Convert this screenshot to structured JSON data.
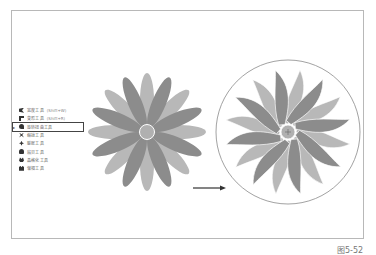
{
  "figure": {
    "caption": "图5-52",
    "frame_color": "#b8b8b8"
  },
  "tool_menu": {
    "items": [
      {
        "label": "宽度工具",
        "shortcut": "(Shift+W)",
        "icon": "width-tool-icon",
        "active": false
      },
      {
        "label": "变形工具",
        "shortcut": "(Shift+R)",
        "icon": "warp-tool-icon",
        "active": false
      },
      {
        "label": "旋转扭曲工具",
        "shortcut": "",
        "icon": "twirl-tool-icon",
        "active": true
      },
      {
        "label": "缩拢工具",
        "shortcut": "",
        "icon": "pucker-tool-icon",
        "active": false
      },
      {
        "label": "膨胀工具",
        "shortcut": "",
        "icon": "bloat-tool-icon",
        "active": false
      },
      {
        "label": "扇贝工具",
        "shortcut": "",
        "icon": "scallop-tool-icon",
        "active": false
      },
      {
        "label": "晶格化工具",
        "shortcut": "",
        "icon": "crystallize-tool-icon",
        "active": false
      },
      {
        "label": "皱褶工具",
        "shortcut": "",
        "icon": "wrinkle-tool-icon",
        "active": false
      }
    ],
    "active_marker": "▸"
  },
  "illustration": {
    "before": {
      "petals": 16,
      "dark": "#8c8c8c",
      "light": "#b8b8b8",
      "center_color": "#b0b0b0"
    },
    "after": {
      "petals": 16,
      "dark": "#8c8c8c",
      "light": "#b8b8b8",
      "circle_stroke": "#8a8a8a"
    },
    "arrow_color": "#333333"
  }
}
